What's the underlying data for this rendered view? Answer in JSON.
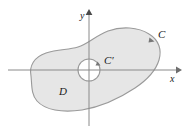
{
  "figure": {
    "type": "vector-diagram",
    "width": 189,
    "height": 131,
    "background_color": "#ffffff",
    "region_fill_color": "#e6e6e6",
    "outline_color": "#9a9a9a",
    "axis_color": "#808080",
    "label_color": "#1a1a1a"
  },
  "axes": {
    "origin": {
      "x": 89,
      "y": 70
    },
    "x_axis": {
      "label": "x",
      "label_pos": {
        "x": 170,
        "y": 82
      },
      "start": {
        "x": 8,
        "y": 70
      },
      "end": {
        "x": 178,
        "y": 70
      },
      "has_arrow": true
    },
    "y_axis": {
      "label": "y",
      "label_pos": {
        "x": 80,
        "y": 19
      },
      "start": {
        "x": 89,
        "y": 126
      },
      "end": {
        "x": 89,
        "y": 12
      },
      "has_arrow": true
    }
  },
  "curves": {
    "outer": {
      "name": "C",
      "label": "C",
      "label_pos": {
        "x": 158,
        "y": 38
      },
      "orientation": "counterclockwise",
      "arrow_pos": {
        "x": 151,
        "y": 42
      }
    },
    "inner": {
      "name": "C'",
      "label": "C′",
      "label_pos": {
        "x": 104,
        "y": 64
      },
      "orientation": "clockwise",
      "arrow_pos": {
        "x": 98,
        "y": 64
      },
      "circle": {
        "cx": 89,
        "cy": 70,
        "r": 11
      }
    }
  },
  "region": {
    "name": "D",
    "label": "D",
    "label_pos": {
      "x": 59,
      "y": 95
    }
  }
}
